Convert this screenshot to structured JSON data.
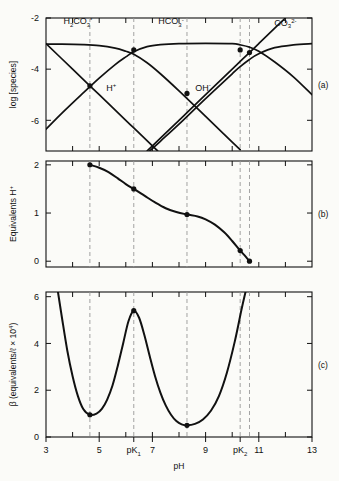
{
  "figure": {
    "background": "#fbfbf8",
    "ink": "#111111",
    "dash_color": "#999999"
  },
  "axis": {
    "x_label": "pH",
    "x_min": 3,
    "x_max": 13,
    "x_ticklabels": [
      "3",
      "5",
      "pK",
      "7",
      "9",
      "pK",
      "11",
      "13"
    ],
    "x_tick_subscripts": [
      "",
      "",
      "1",
      "",
      "",
      "2",
      "",
      ""
    ],
    "x_tickvalues": [
      3,
      5,
      6.3,
      7,
      9,
      10.3,
      11,
      13
    ],
    "x_minor_ticks": [
      4,
      5,
      6,
      7,
      8,
      9,
      10,
      11,
      12
    ],
    "pK1": 6.3,
    "pK2": 10.3,
    "dashed_lines": [
      4.65,
      6.3,
      8.3,
      10.3,
      10.65
    ]
  },
  "panels": [
    {
      "id": "a",
      "label": "(a)",
      "y_label": "log [species]",
      "y_min": -7.2,
      "y_max": -2,
      "y_ticks": [
        -2,
        -4,
        -6
      ],
      "y_ticklabels": [
        "-2",
        "-4",
        "-6"
      ],
      "region_labels": [
        {
          "name": "h2co3",
          "text": "H",
          "sub": "2",
          "text2": "CO",
          "sub2": "3",
          "sup": "*",
          "x": 4.2,
          "y": -2.25
        },
        {
          "name": "hco3",
          "text": "HCO",
          "sub": "3",
          "sup": "-",
          "x": 7.7,
          "y": -2.25
        },
        {
          "name": "co3",
          "text": "CO",
          "sub": "3",
          "sup": "2-",
          "x": 12.0,
          "y": -2.3
        }
      ],
      "curve_labels": [
        {
          "name": "h-plus",
          "text": "H",
          "sup": "+",
          "x": 5.45,
          "y": -4.85
        },
        {
          "name": "oh-minus",
          "text": "OH",
          "sup": "-",
          "x": 8.9,
          "y": -4.85
        }
      ],
      "intersection_points": [
        {
          "x": 4.65,
          "y": -4.65
        },
        {
          "x": 6.3,
          "y": -3.25
        },
        {
          "x": 8.3,
          "y": -4.95
        },
        {
          "x": 10.3,
          "y": -3.25
        },
        {
          "x": 10.65,
          "y": -3.35
        }
      ],
      "series": [
        {
          "name": "H2CO3*",
          "points": [
            [
              3,
              -3.02
            ],
            [
              3.6,
              -3.02
            ],
            [
              4.4,
              -3.04
            ],
            [
              5,
              -3.08
            ],
            [
              5.6,
              -3.18
            ],
            [
              6.0,
              -3.3
            ],
            [
              6.3,
              -3.42
            ],
            [
              6.8,
              -3.75
            ],
            [
              7.3,
              -4.18
            ],
            [
              8,
              -4.85
            ],
            [
              9,
              -5.85
            ],
            [
              10,
              -6.85
            ],
            [
              10.3,
              -7.15
            ]
          ]
        },
        {
          "name": "HCO3-",
          "points": [
            [
              3,
              -6.35
            ],
            [
              3.6,
              -5.72
            ],
            [
              4.4,
              -4.93
            ],
            [
              5,
              -4.35
            ],
            [
              5.6,
              -3.82
            ],
            [
              6.0,
              -3.52
            ],
            [
              6.3,
              -3.32
            ],
            [
              6.8,
              -3.12
            ],
            [
              7.3,
              -3.04
            ],
            [
              8,
              -3.0
            ],
            [
              9,
              -2.99
            ],
            [
              10,
              -3.0
            ],
            [
              10.3,
              -3.05
            ],
            [
              10.65,
              -3.14
            ],
            [
              11,
              -3.3
            ],
            [
              11.6,
              -3.72
            ],
            [
              12.3,
              -4.3
            ],
            [
              13,
              -5.0
            ]
          ]
        },
        {
          "name": "CO3 2-",
          "points": [
            [
              6.9,
              -7.2
            ],
            [
              7.3,
              -6.82
            ],
            [
              8,
              -6.15
            ],
            [
              9,
              -5.15
            ],
            [
              10,
              -4.18
            ],
            [
              10.3,
              -3.9
            ],
            [
              10.65,
              -3.62
            ],
            [
              11,
              -3.4
            ],
            [
              11.6,
              -3.16
            ],
            [
              12.3,
              -3.05
            ],
            [
              13,
              -3.0
            ]
          ]
        },
        {
          "name": "H+",
          "points": [
            [
              3,
              -3.0
            ],
            [
              4,
              -4.0
            ],
            [
              4.65,
              -4.65
            ],
            [
              5,
              -5.0
            ],
            [
              6,
              -6.0
            ],
            [
              6.3,
              -6.3
            ],
            [
              7,
              -7.0
            ],
            [
              7.2,
              -7.2
            ]
          ]
        },
        {
          "name": "OH-",
          "points": [
            [
              6.8,
              -7.2
            ],
            [
              7,
              -7.0
            ],
            [
              8,
              -6.0
            ],
            [
              8.3,
              -5.7
            ],
            [
              9,
              -5.0
            ],
            [
              10,
              -4.0
            ],
            [
              10.3,
              -3.7
            ],
            [
              11,
              -3.0
            ],
            [
              11.6,
              -2.4
            ],
            [
              12,
              -2.0
            ]
          ]
        }
      ]
    },
    {
      "id": "b",
      "label": "(b)",
      "y_label": "Equivalents H",
      "y_label_sup": "+",
      "y_min": -0.12,
      "y_max": 2.08,
      "y_ticks": [
        0,
        1,
        2
      ],
      "y_ticklabels": [
        "0",
        "1",
        "2"
      ],
      "marker_points": [
        {
          "x": 4.65,
          "y": 2.0
        },
        {
          "x": 6.3,
          "y": 1.5
        },
        {
          "x": 8.3,
          "y": 0.97
        },
        {
          "x": 10.3,
          "y": 0.22
        },
        {
          "x": 10.65,
          "y": 0.0
        }
      ],
      "curve": [
        [
          4.65,
          2.0
        ],
        [
          5.0,
          1.94
        ],
        [
          5.35,
          1.85
        ],
        [
          5.7,
          1.72
        ],
        [
          6.0,
          1.6
        ],
        [
          6.3,
          1.5
        ],
        [
          6.7,
          1.36
        ],
        [
          7.1,
          1.22
        ],
        [
          7.5,
          1.1
        ],
        [
          7.9,
          1.02
        ],
        [
          8.3,
          0.97
        ],
        [
          8.7,
          0.93
        ],
        [
          9.0,
          0.87
        ],
        [
          9.35,
          0.76
        ],
        [
          9.7,
          0.6
        ],
        [
          10.0,
          0.42
        ],
        [
          10.3,
          0.22
        ],
        [
          10.5,
          0.1
        ],
        [
          10.65,
          0.0
        ]
      ]
    },
    {
      "id": "c",
      "label": "(c)",
      "y_label": "β (equivalents/ℓ × 10",
      "y_label_sup": "4",
      "y_label_close": ")",
      "y_min": 0,
      "y_max": 6.2,
      "y_ticks": [
        0,
        2,
        4,
        6
      ],
      "y_ticklabels": [
        "0",
        "2",
        "4",
        "6"
      ],
      "marker_points": [
        {
          "x": 4.65,
          "y": 0.95
        },
        {
          "x": 6.3,
          "y": 5.4
        },
        {
          "x": 8.3,
          "y": 0.5
        }
      ],
      "curve": [
        [
          3.45,
          6.2
        ],
        [
          3.6,
          5.1
        ],
        [
          3.8,
          3.7
        ],
        [
          4.0,
          2.6
        ],
        [
          4.2,
          1.75
        ],
        [
          4.4,
          1.2
        ],
        [
          4.65,
          0.95
        ],
        [
          4.9,
          1.0
        ],
        [
          5.1,
          1.2
        ],
        [
          5.3,
          1.6
        ],
        [
          5.5,
          2.2
        ],
        [
          5.7,
          3.05
        ],
        [
          5.9,
          4.0
        ],
        [
          6.1,
          4.95
        ],
        [
          6.3,
          5.4
        ],
        [
          6.5,
          5.1
        ],
        [
          6.7,
          4.35
        ],
        [
          6.9,
          3.45
        ],
        [
          7.1,
          2.6
        ],
        [
          7.3,
          1.9
        ],
        [
          7.5,
          1.35
        ],
        [
          7.7,
          0.95
        ],
        [
          7.9,
          0.68
        ],
        [
          8.1,
          0.54
        ],
        [
          8.3,
          0.5
        ],
        [
          8.6,
          0.56
        ],
        [
          8.9,
          0.75
        ],
        [
          9.2,
          1.12
        ],
        [
          9.5,
          1.75
        ],
        [
          9.8,
          2.75
        ],
        [
          10.1,
          4.1
        ],
        [
          10.35,
          5.45
        ],
        [
          10.5,
          6.2
        ]
      ]
    }
  ],
  "chart_data": {
    "type": "line",
    "xlabel": "pH",
    "xlim": [
      3,
      13
    ],
    "grid": false,
    "legend": "inline-labels",
    "panels": [
      {
        "panel": "a",
        "ylabel": "log [species]",
        "ylim": [
          -7.2,
          -2
        ],
        "yticks": [
          -2,
          -4,
          -6
        ],
        "annotations": [
          "H2CO3*",
          "HCO3-",
          "CO3 2-",
          "H+",
          "OH-"
        ],
        "series": [
          {
            "name": "H2CO3*",
            "x": [
              3,
              4.4,
              5.6,
              6.3,
              7.3,
              8,
              9,
              10,
              10.3
            ],
            "y": [
              -3.02,
              -3.04,
              -3.18,
              -3.42,
              -4.18,
              -4.85,
              -5.85,
              -6.85,
              -7.15
            ]
          },
          {
            "name": "HCO3-",
            "x": [
              3,
              4.4,
              5.6,
              6.3,
              7.3,
              9,
              10.3,
              11,
              12.3,
              13
            ],
            "y": [
              -6.35,
              -4.93,
              -3.82,
              -3.32,
              -3.04,
              -2.99,
              -3.05,
              -3.3,
              -4.3,
              -5.0
            ]
          },
          {
            "name": "CO3 2-",
            "x": [
              6.9,
              8,
              9,
              10.3,
              11,
              12.3,
              13
            ],
            "y": [
              -7.2,
              -6.15,
              -5.15,
              -3.9,
              -3.4,
              -3.05,
              -3.0
            ]
          },
          {
            "name": "H+",
            "x": [
              3,
              4.65,
              6.3,
              7.2
            ],
            "y": [
              -3.0,
              -4.65,
              -6.3,
              -7.2
            ]
          },
          {
            "name": "OH-",
            "x": [
              6.8,
              8.3,
              10.3,
              12
            ],
            "y": [
              -7.2,
              -5.7,
              -3.7,
              -2.0
            ]
          }
        ]
      },
      {
        "panel": "b",
        "ylabel": "Equivalents H+",
        "ylim": [
          0,
          2
        ],
        "yticks": [
          0,
          1,
          2
        ],
        "series": [
          {
            "name": "titration",
            "x": [
              4.65,
              6.3,
              8.3,
              10.3,
              10.65
            ],
            "y": [
              2.0,
              1.5,
              0.97,
              0.22,
              0.0
            ]
          }
        ]
      },
      {
        "panel": "c",
        "ylabel": "β (equivalents/ℓ × 10^4)",
        "ylim": [
          0,
          6
        ],
        "yticks": [
          0,
          2,
          4,
          6
        ],
        "series": [
          {
            "name": "buffer intensity",
            "x": [
              4.65,
              6.3,
              8.3
            ],
            "y": [
              0.95,
              5.4,
              0.5
            ]
          }
        ],
        "features": {
          "minima": [
            [
              4.65,
              0.95
            ],
            [
              8.3,
              0.5
            ]
          ],
          "maxima": [
            [
              6.3,
              5.4
            ]
          ]
        }
      }
    ]
  }
}
